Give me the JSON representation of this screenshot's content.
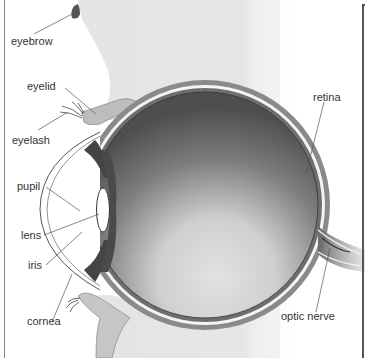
{
  "diagram": {
    "labels": [
      {
        "id": "eyebrow",
        "text": "eyebrow"
      },
      {
        "id": "eyelid",
        "text": "eyelid"
      },
      {
        "id": "eyelash",
        "text": "eyelash"
      },
      {
        "id": "retina",
        "text": "retina"
      },
      {
        "id": "pupil",
        "text": "pupil"
      },
      {
        "id": "lens",
        "text": "lens"
      },
      {
        "id": "iris",
        "text": "iris"
      },
      {
        "id": "cornea",
        "text": "cornea"
      },
      {
        "id": "optic_nerve",
        "text": "optic nerve"
      }
    ],
    "colors": {
      "skin": "#c9c9c9",
      "background_panel": "#e6e6e6",
      "eyeball_dark": "#5a5a5a",
      "eyeball_light": "#dcdcdc",
      "sclera_band": "#7a7a7a",
      "label_text": "#333333",
      "leader_line": "#555555"
    }
  }
}
